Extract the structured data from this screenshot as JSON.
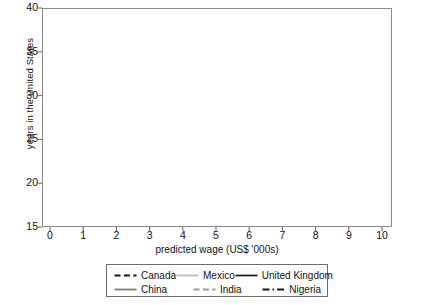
{
  "chart_data": {
    "type": "line",
    "title": "",
    "xlabel": "predicted wage (US$ '000s)",
    "ylabel": "years in the United States",
    "xlim": [
      0,
      10
    ],
    "ylim": [
      15,
      40
    ],
    "xticks": [
      "0",
      "1",
      "2",
      "3",
      "4",
      "5",
      "6",
      "7",
      "8",
      "9",
      "10"
    ],
    "yticks": [
      "15",
      "20",
      "25",
      "30",
      "35",
      "40"
    ],
    "grid": false,
    "legend_position": "below-axes",
    "x": [
      0,
      1,
      2,
      3,
      4,
      5,
      6,
      7,
      8,
      9,
      10
    ],
    "series": [
      {
        "name": "Canada",
        "style": "dashed",
        "color": "#1a1a1a",
        "values": [
          28.0,
          29.2,
          30.3,
          31.3,
          32.3,
          33.2,
          34.1,
          35.0,
          35.8,
          36.5,
          37.2
        ]
      },
      {
        "name": "China",
        "style": "solid",
        "color": "#7d7d7d",
        "values": [
          19.3,
          20.1,
          20.9,
          21.6,
          22.3,
          23.0,
          23.7,
          24.3,
          24.9,
          25.4,
          25.9
        ]
      },
      {
        "name": "Mexico",
        "style": "solid",
        "color": "#bdbdbd",
        "values": [
          17.4,
          18.1,
          18.8,
          19.4,
          20.0,
          20.6,
          21.2,
          21.7,
          22.2,
          22.7,
          23.1
        ]
      },
      {
        "name": "India",
        "style": "dashed",
        "color": "#9a9a9a",
        "values": [
          23.4,
          24.3,
          25.1,
          25.9,
          26.7,
          27.5,
          28.3,
          29.1,
          29.9,
          30.7,
          31.5
        ]
      },
      {
        "name": "United Kingdom",
        "style": "solid",
        "color": "#1a1a1a",
        "values": [
          28.2,
          29.5,
          30.6,
          31.7,
          32.7,
          33.7,
          34.6,
          35.5,
          36.3,
          37.1,
          37.8
        ]
      },
      {
        "name": "Nigeria",
        "style": "dashdot",
        "color": "#1a1a1a",
        "values": [
          20.9,
          21.6,
          22.3,
          23.0,
          23.7,
          24.4,
          25.0,
          25.7,
          26.3,
          26.9,
          27.5
        ]
      }
    ]
  },
  "legend": {
    "rows": [
      [
        {
          "label": "Canada",
          "series": 0
        },
        {
          "label": "Mexico",
          "series": 2
        },
        {
          "label": "United Kingdom",
          "series": 4
        }
      ],
      [
        {
          "label": "China",
          "series": 1
        },
        {
          "label": "India",
          "series": 3
        },
        {
          "label": "Nigeria",
          "series": 5
        }
      ]
    ]
  },
  "axis": {
    "frame_color": "#8a8a8a",
    "tick_color": "#6e6e6e"
  }
}
